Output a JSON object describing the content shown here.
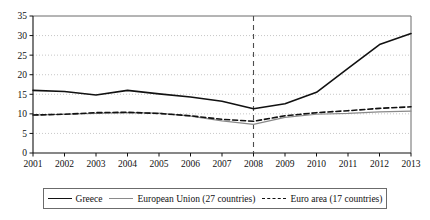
{
  "chart_data": {
    "type": "line",
    "title": "",
    "subtitle": "",
    "xlabel": "",
    "ylabel": "",
    "x": [
      2001,
      2002,
      2003,
      2004,
      2005,
      2006,
      2007,
      2008,
      2009,
      2010,
      2011,
      2012,
      2013
    ],
    "xtick_labels": [
      "2001",
      "2002",
      "2003",
      "2004",
      "2005",
      "2006",
      "2007",
      "2008",
      "2009",
      "2010",
      "2011",
      "2012",
      "2013"
    ],
    "ytick_labels": [
      "0",
      "5",
      "10",
      "15",
      "20",
      "25",
      "30",
      "35"
    ],
    "yticks": [
      0,
      5,
      10,
      15,
      20,
      25,
      30,
      35
    ],
    "ylim": [
      0,
      35
    ],
    "xlim": [
      2001,
      2013
    ],
    "grid": "horizontal-dotted",
    "legend_position": "bottom",
    "annotations": [
      {
        "type": "vertical-line",
        "x": 2008,
        "style": "dashed",
        "color": "#4d4d4d"
      }
    ],
    "series": [
      {
        "name": "Greece",
        "color": "#111111",
        "style": "solid",
        "width": 1.6,
        "values": [
          16.0,
          15.7,
          14.8,
          16.0,
          15.1,
          14.3,
          13.2,
          11.3,
          12.6,
          15.5,
          21.6,
          27.7,
          30.5
        ]
      },
      {
        "name": "European Union (27 countries)",
        "color": "#8a8a8a",
        "style": "solid",
        "width": 1.2,
        "values": [
          9.7,
          9.9,
          10.1,
          10.3,
          10.2,
          9.4,
          8.2,
          7.3,
          9.1,
          9.9,
          10.1,
          10.5,
          10.7
        ]
      },
      {
        "name": "Euro area (17 countries)",
        "color": "#111111",
        "style": "dashed",
        "width": 1.6,
        "values": [
          9.7,
          9.9,
          10.3,
          10.4,
          10.1,
          9.5,
          8.6,
          8.1,
          9.5,
          10.3,
          10.8,
          11.4,
          11.8
        ]
      }
    ]
  },
  "legend": {
    "entries": [
      {
        "label": "Greece",
        "swatch": "solid-dark-line-icon"
      },
      {
        "label": "European Union (27 countries)",
        "swatch": "solid-gray-line-icon"
      },
      {
        "label": "Euro area (17 countries)",
        "swatch": "dashed-dark-line-icon"
      }
    ]
  }
}
